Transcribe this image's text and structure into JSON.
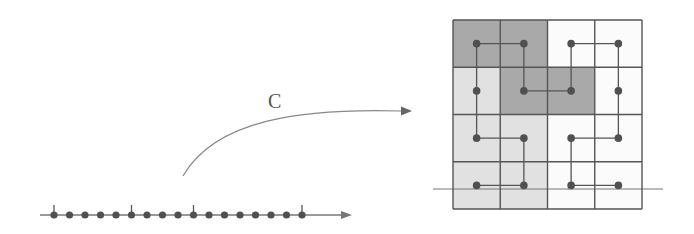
{
  "diagram": {
    "mapping_label": "C",
    "line": {
      "dot_count": 17,
      "tick_indices": [
        0,
        5,
        9,
        16
      ],
      "x_start": 40,
      "x_end": 352,
      "y": 215,
      "first_dot_x": 54,
      "last_dot_x": 302
    },
    "grid": {
      "rows": 4,
      "cols": 4,
      "x0": 453,
      "y0": 20,
      "cell": 47.25,
      "shading": [
        [
          "dark",
          "dark",
          "white",
          "white"
        ],
        [
          "light",
          "dark",
          "dark",
          "white"
        ],
        [
          "light",
          "light",
          "white",
          "white"
        ],
        [
          "light",
          "light",
          "white",
          "white"
        ]
      ],
      "path": [
        [
          3,
          0
        ],
        [
          3,
          1
        ],
        [
          2,
          1
        ],
        [
          2,
          0
        ],
        [
          1,
          0
        ],
        [
          0,
          0
        ],
        [
          0,
          1
        ],
        [
          1,
          1
        ],
        [
          1,
          2
        ],
        [
          0,
          2
        ],
        [
          0,
          3
        ],
        [
          1,
          3
        ],
        [
          2,
          3
        ],
        [
          2,
          2
        ],
        [
          3,
          2
        ],
        [
          3,
          3
        ]
      ],
      "axis_line": {
        "x_start": 433,
        "x_end": 663,
        "y": 189
      }
    },
    "colors": {
      "dark": "#a9a9a9",
      "light": "#e1e1e1",
      "white": "#fbfbfb",
      "stroke": "#555555",
      "dot": "#505050",
      "thin": "#777777"
    }
  }
}
